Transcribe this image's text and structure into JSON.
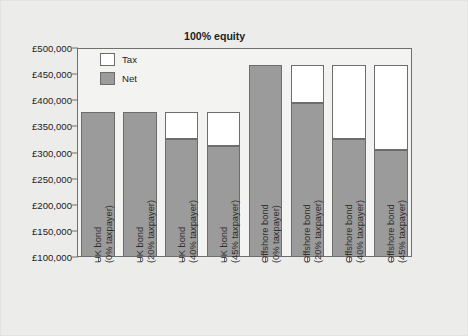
{
  "chart_data": {
    "type": "bar",
    "subtype": "stacked-bar",
    "title": "100% equity",
    "xlabel": "",
    "ylabel": "",
    "ylim": [
      100000,
      500000
    ],
    "ytick_values": [
      100000,
      150000,
      200000,
      250000,
      300000,
      350000,
      400000,
      450000,
      500000
    ],
    "ytick_labels": [
      "£100,000",
      "£150,000",
      "£200,000",
      "£250,000",
      "£300,000",
      "£350,000",
      "£400,000",
      "£450,000",
      "£500,000"
    ],
    "currency": "GBP",
    "grid": false,
    "legend_position": "upper-left-inside",
    "categories": [
      "UK bond (0% taxpayer)",
      "UK bond (20% taxpayer)",
      "UK bond (40% taxpayer)",
      "UK bond (45% taxpayer)",
      "Offshore bond (0% taxpayer)",
      "Offshore bond (20% taxpayer)",
      "Offshore bond (40% taxpayer)",
      "Offshore bond (45% taxpayer)"
    ],
    "category_lines": [
      [
        "UK bond",
        "(0% taxpayer)"
      ],
      [
        "UK bond",
        "(20% taxpayer)"
      ],
      [
        "UK bond",
        "(40% taxpayer)"
      ],
      [
        "UK bond",
        "(45% taxpayer)"
      ],
      [
        "Offshore bond",
        "(0% taxpayer)"
      ],
      [
        "Offshore bond",
        "(20% taxpayer)"
      ],
      [
        "Offshore bond",
        "(40% taxpayer)"
      ],
      [
        "Offshore bond",
        "(45% taxpayer)"
      ]
    ],
    "series": [
      {
        "name": "Net",
        "color": "#9b9b9b",
        "values": [
          378000,
          378000,
          326000,
          312000,
          467000,
          394000,
          326000,
          305000
        ]
      },
      {
        "name": "Tax",
        "color": "#ffffff",
        "values": [
          0,
          0,
          52000,
          66000,
          0,
          73000,
          141000,
          162000
        ]
      }
    ],
    "totals": [
      378000,
      378000,
      378000,
      378000,
      467000,
      467000,
      467000,
      467000
    ]
  },
  "legend": {
    "items": [
      {
        "label": "Tax",
        "color": "#ffffff"
      },
      {
        "label": "Net",
        "color": "#9b9b9b"
      }
    ]
  },
  "colors": {
    "net": "#9b9b9b",
    "tax": "#ffffff",
    "axis": "#6f6f6f",
    "background": "#ececeb",
    "plot_background": "#f3f3f2",
    "text": "#222222"
  }
}
